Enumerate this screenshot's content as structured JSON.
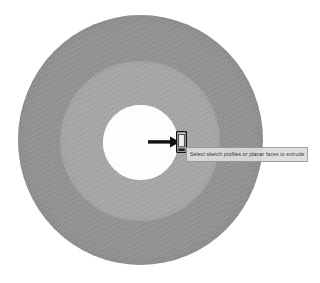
{
  "viewport": {
    "name": "cad-3d-viewport",
    "background_color": "#ffffff"
  },
  "model": {
    "description": "Concentric annular disc (washer / flanged boss) shown in an isometric-front CAD view",
    "features": [
      {
        "name": "outer-disc-face",
        "shape": "circle",
        "color": "#949494",
        "center": [
          140,
          140
        ],
        "radius": 123
      },
      {
        "name": "middle-boss-face",
        "shape": "circle",
        "color": "#a9a9a9",
        "center": [
          140,
          141
        ],
        "radius": 80
      },
      {
        "name": "center-through-hole",
        "shape": "circle",
        "color": "#fdfdfd",
        "center": [
          140,
          142
        ],
        "radius": 37
      }
    ]
  },
  "annotation": {
    "arrow_label": "pointer-callout-arrow",
    "arrow_direction": "right",
    "arrow_color": "#111111"
  },
  "cursor": {
    "label": "selection-cursor",
    "color": "#1a1a1a"
  },
  "tooltip": {
    "text": "Select sketch profiles or planar faces to extrude",
    "background_color": "#dcdcdc",
    "border_color": "#9a9a9a",
    "text_color": "#2b2b2b"
  }
}
